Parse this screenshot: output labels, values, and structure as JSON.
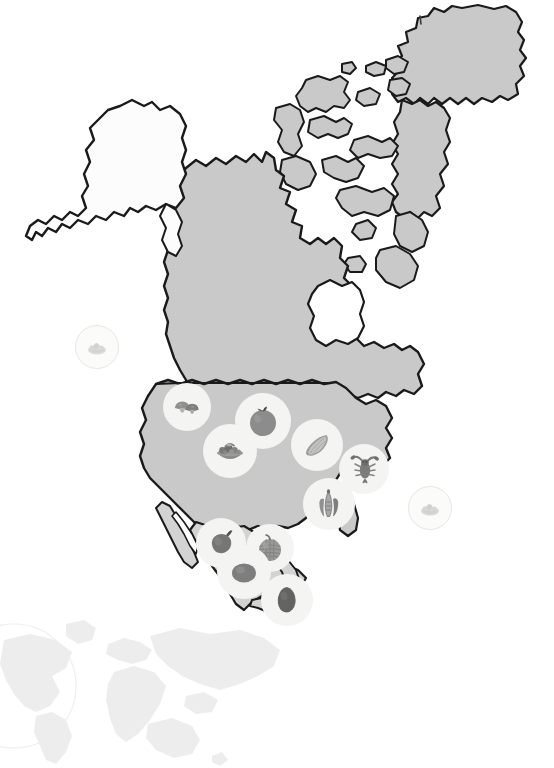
{
  "page": {
    "width": 554,
    "height": 768,
    "background_color": "#ffffff"
  },
  "colors": {
    "land_fill": "#c9c9c9",
    "land_fill_secondary": "#d3d3d3",
    "land_outline": "#1a1a1a",
    "alaska_fill": "#fcfcfc",
    "greenland_fill": "#c9c9c9",
    "marker_disc": "#f4f4f2",
    "marker_faded": "#fbfbfa",
    "icon_dark": "#6e6e6e",
    "icon_mid": "#9a9a9a",
    "icon_light": "#c4c4c4",
    "watermark": "#ededed"
  },
  "map": {
    "name": "north-america",
    "regions": [
      {
        "id": "alaska",
        "label": "Alaska",
        "fill": "#fcfcfc"
      },
      {
        "id": "canada",
        "label": "Canada",
        "fill": "#c9c9c9"
      },
      {
        "id": "greenland",
        "label": "Greenland",
        "fill": "#c9c9c9"
      },
      {
        "id": "united-states",
        "label": "United States",
        "fill": "#c9c9c9"
      },
      {
        "id": "mexico",
        "label": "Mexico",
        "fill": "#d3d3d3"
      },
      {
        "id": "arctic-islands",
        "label": "Canadian Arctic Archipelago",
        "fill": "#c9c9c9"
      }
    ]
  },
  "markers": [
    {
      "id": "marker-pacific-offshore",
      "icon": "salad-bowl-icon",
      "label": "Salad bowl",
      "style": "faded",
      "x": 75,
      "y": 325,
      "size": 44,
      "icon_size": 24
    },
    {
      "id": "marker-pacific-northwest",
      "icon": "mushrooms-icon",
      "label": "Mushrooms",
      "style": "disc",
      "x": 163,
      "y": 383,
      "size": 48,
      "icon_size": 30
    },
    {
      "id": "marker-midwest-apple",
      "icon": "apple-icon",
      "label": "Apple",
      "style": "disc",
      "x": 235,
      "y": 393,
      "size": 56,
      "icon_size": 34
    },
    {
      "id": "marker-southwest-salad",
      "icon": "salad-bowl-icon",
      "label": "Salad bowl",
      "style": "disc",
      "x": 203,
      "y": 424,
      "size": 54,
      "icon_size": 34
    },
    {
      "id": "marker-great-lakes-corn",
      "icon": "corn-icon",
      "label": "Corn cob",
      "style": "disc",
      "x": 291,
      "y": 419,
      "size": 52,
      "icon_size": 32
    },
    {
      "id": "marker-northeast-lobster",
      "icon": "lobster-icon",
      "label": "Lobster",
      "style": "disc",
      "x": 339,
      "y": 444,
      "size": 50,
      "icon_size": 32
    },
    {
      "id": "marker-southeast-shrimp",
      "icon": "shrimp-icon",
      "label": "Shrimp",
      "style": "disc",
      "x": 303,
      "y": 478,
      "size": 52,
      "icon_size": 32
    },
    {
      "id": "marker-atlantic-offshore",
      "icon": "salad-bowl-icon",
      "label": "Salad bowl",
      "style": "faded",
      "x": 408,
      "y": 486,
      "size": 44,
      "icon_size": 24
    },
    {
      "id": "marker-baja-pepper",
      "icon": "chili-pepper-icon",
      "label": "Chili pepper",
      "style": "disc",
      "x": 196,
      "y": 518,
      "size": 50,
      "icon_size": 32
    },
    {
      "id": "marker-central-mexico-melon",
      "icon": "melon-icon",
      "label": "Melon",
      "style": "disc",
      "x": 246,
      "y": 524,
      "size": 48,
      "icon_size": 30
    },
    {
      "id": "marker-pacific-mexico-avocado",
      "icon": "avocado-icon",
      "label": "Avocado",
      "style": "disc",
      "x": 217,
      "y": 545,
      "size": 54,
      "icon_size": 36
    },
    {
      "id": "marker-yucatan-avocado",
      "icon": "avocado-icon",
      "label": "Avocado",
      "style": "disc",
      "x": 261,
      "y": 574,
      "size": 52,
      "icon_size": 34
    }
  ],
  "watermark": {
    "id": "world-map-watermark",
    "label": "World map watermark",
    "x": 0,
    "y": 618,
    "width": 260,
    "height": 150,
    "color": "#ededed"
  }
}
